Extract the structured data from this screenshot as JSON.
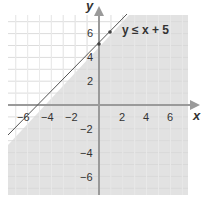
{
  "chart_data": {
    "type": "inequality-graph",
    "title": "",
    "inequality": "y ≤ x + 5",
    "boundary_line": {
      "slope": 1,
      "intercept": 5,
      "style": "solid"
    },
    "shaded_region": "below line",
    "points": [
      {
        "x": 0,
        "y": 5
      },
      {
        "x": 1,
        "y": 6
      }
    ],
    "xlabel": "x",
    "ylabel": "y",
    "xlim": [
      -7.5,
      7.5
    ],
    "ylim": [
      -7.5,
      7.5
    ],
    "x_ticks": [
      "-6",
      "-4",
      "-2",
      "2",
      "4",
      "6"
    ],
    "y_ticks": [
      "6",
      "4",
      "2",
      "-2",
      "-4",
      "-6"
    ],
    "grid": true,
    "colors": {
      "shade": "#e3e3e3",
      "grid": "#d9d9d9",
      "axis": "#9a9a9a",
      "line": "#555555",
      "point": "#444444"
    }
  },
  "labels": {
    "x_axis": "x",
    "y_axis": "y",
    "inequality": "y ≤ x + 5",
    "ticks": {
      "xn6": "−6",
      "xn4": "−4",
      "xn2": "−2",
      "x2": "2",
      "x4": "4",
      "x6": "6",
      "y6": "6",
      "y4": "4",
      "y2": "2",
      "yn2": "−2",
      "yn4": "−4",
      "yn6": "−6"
    }
  }
}
